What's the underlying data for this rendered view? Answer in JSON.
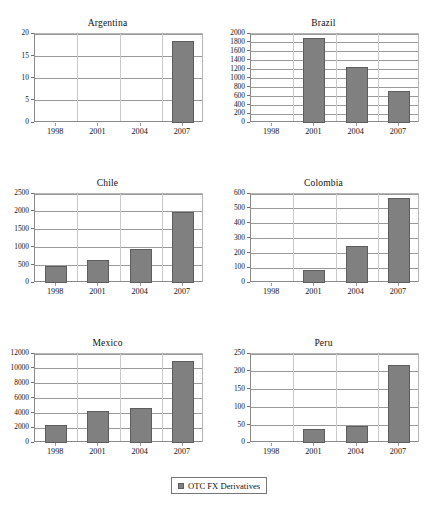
{
  "figure": {
    "legend_label": "OTC FX Derivatives",
    "bar_color": "#808080",
    "bar_border_color": "#5d5d5d",
    "grid_color": "#9a9a9a",
    "axis_color": "#8a8a8a"
  },
  "chart_data": [
    {
      "type": "bar",
      "title": "Argentina",
      "categories": [
        "1998",
        "2001",
        "2004",
        "2007"
      ],
      "values": [
        null,
        null,
        null,
        18.5
      ],
      "series": [
        {
          "name": "OTC FX Derivatives",
          "values": [
            null,
            null,
            null,
            18.5
          ]
        }
      ],
      "xlabel": "",
      "ylabel": "",
      "ylim": [
        0,
        20
      ],
      "yticks": [
        0,
        5,
        10,
        15,
        20
      ],
      "ytick_labels": [
        "0",
        "5",
        "10",
        "15",
        "20"
      ],
      "grid": true,
      "legend_position": "bottom"
    },
    {
      "type": "bar",
      "title": "Brazil",
      "categories": [
        "1998",
        "2001",
        "2004",
        "2007"
      ],
      "values": [
        null,
        1900,
        1260,
        720
      ],
      "series": [
        {
          "name": "OTC FX Derivatives",
          "values": [
            null,
            1900,
            1260,
            720
          ]
        }
      ],
      "xlabel": "",
      "ylabel": "",
      "ylim": [
        0,
        2000
      ],
      "yticks": [
        0,
        200,
        400,
        600,
        800,
        1000,
        1200,
        1400,
        1600,
        1800,
        2000
      ],
      "ytick_labels": [
        "0",
        "200",
        "400",
        "600",
        "800",
        "1000",
        "1200",
        "1400",
        "1600",
        "1800",
        "2000"
      ],
      "grid": true,
      "legend_position": "bottom"
    },
    {
      "type": "bar",
      "title": "Chile",
      "categories": [
        "1998",
        "2001",
        "2004",
        "2007"
      ],
      "values": [
        470,
        650,
        960,
        2000
      ],
      "series": [
        {
          "name": "OTC FX Derivatives",
          "values": [
            470,
            650,
            960,
            2000
          ]
        }
      ],
      "xlabel": "",
      "ylabel": "",
      "ylim": [
        0,
        2500
      ],
      "yticks": [
        0,
        500,
        1000,
        1500,
        2000,
        2500
      ],
      "ytick_labels": [
        "0",
        "500",
        "1000",
        "1500",
        "2000",
        "2500"
      ],
      "grid": true,
      "legend_position": "bottom"
    },
    {
      "type": "bar",
      "title": "Colombia",
      "categories": [
        "1998",
        "2001",
        "2004",
        "2007"
      ],
      "values": [
        null,
        85,
        250,
        575
      ],
      "series": [
        {
          "name": "OTC FX Derivatives",
          "values": [
            null,
            85,
            250,
            575
          ]
        }
      ],
      "xlabel": "",
      "ylabel": "",
      "ylim": [
        0,
        600
      ],
      "yticks": [
        0,
        100,
        200,
        300,
        400,
        500,
        600
      ],
      "ytick_labels": [
        "0",
        "100",
        "200",
        "300",
        "400",
        "500",
        "600"
      ],
      "grid": true,
      "legend_position": "bottom"
    },
    {
      "type": "bar",
      "title": "Mexico",
      "categories": [
        "1998",
        "2001",
        "2004",
        "2007"
      ],
      "values": [
        2400,
        4300,
        4700,
        11000
      ],
      "series": [
        {
          "name": "OTC FX Derivatives",
          "values": [
            2400,
            4300,
            4700,
            11000
          ]
        }
      ],
      "xlabel": "",
      "ylabel": "",
      "ylim": [
        0,
        12000
      ],
      "yticks": [
        0,
        2000,
        4000,
        6000,
        8000,
        10000,
        12000
      ],
      "ytick_labels": [
        "0",
        "2000",
        "4000",
        "6000",
        "8000",
        "10000",
        "12000"
      ],
      "grid": true,
      "legend_position": "bottom"
    },
    {
      "type": "bar",
      "title": "Peru",
      "categories": [
        "1998",
        "2001",
        "2004",
        "2007"
      ],
      "values": [
        null,
        38,
        48,
        218
      ],
      "series": [
        {
          "name": "OTC FX Derivatives",
          "values": [
            null,
            38,
            48,
            218
          ]
        }
      ],
      "xlabel": "",
      "ylabel": "",
      "ylim": [
        0,
        250
      ],
      "yticks": [
        0,
        50,
        100,
        150,
        200,
        250
      ],
      "ytick_labels": [
        "0",
        "50",
        "100",
        "150",
        "200",
        "250"
      ],
      "grid": true,
      "legend_position": "bottom"
    }
  ]
}
